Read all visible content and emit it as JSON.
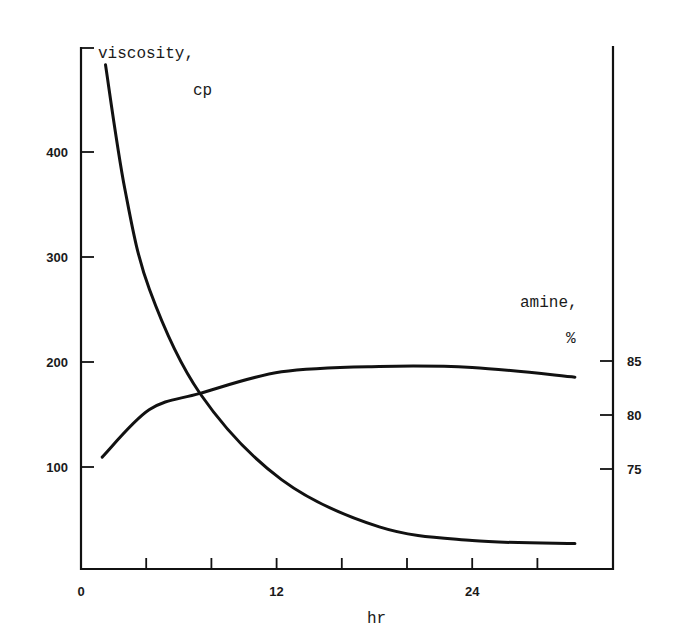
{
  "chart_data": {
    "type": "line",
    "title": "",
    "xlabel": "hr",
    "ylabel_left": "viscosity, cp",
    "ylabel_right": "amine, %",
    "ylabel_left_lines": [
      "viscosity,",
      "cp"
    ],
    "ylabel_right_lines": [
      "amine,",
      "%"
    ],
    "x_ticks": [
      0,
      4,
      8,
      12,
      16,
      20,
      24,
      28
    ],
    "x_tick_labels": [
      "0",
      "",
      "",
      "12",
      "",
      "",
      "24",
      ""
    ],
    "y_left_ticks": [
      100,
      200,
      300,
      400
    ],
    "y_left_tick_labels": [
      "100",
      "200",
      "300",
      "400"
    ],
    "y_right_ticks": [
      75,
      80,
      85
    ],
    "y_right_tick_labels": [
      "75",
      "80",
      "85"
    ],
    "xlim": [
      0,
      32.6
    ],
    "ylim_left": [
      0,
      500
    ],
    "ylim_right": [
      65.6,
      108.5
    ],
    "grid": false,
    "legend": "none (curves identified by axis labels)",
    "series": [
      {
        "name": "viscosity",
        "axis": "left",
        "unit": "cp",
        "x": [
          1.5,
          2.7,
          4.2,
          7.3,
          12.3,
          18.3,
          24.0,
          30.3
        ],
        "values": [
          483,
          364,
          269,
          170,
          88,
          43,
          30,
          27
        ]
      },
      {
        "name": "amine",
        "axis": "right",
        "unit": "%",
        "x": [
          1.3,
          4.2,
          7.3,
          12.3,
          18.3,
          24.0,
          30.3
        ],
        "values": [
          76.1,
          80.5,
          82.0,
          84.0,
          84.5,
          84.4,
          83.5
        ]
      }
    ]
  }
}
